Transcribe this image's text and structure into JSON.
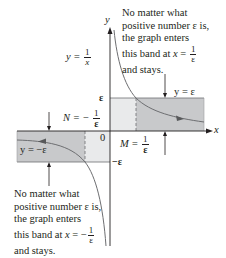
{
  "figure": {
    "type": "diagram",
    "curve_label": {
      "lhs": "y =",
      "num": "1",
      "den": "x"
    },
    "axes": {
      "x_label": "x",
      "y_label": "y",
      "origin_label": "0"
    },
    "y_ticks": {
      "top": "ε",
      "bottom": "−ε"
    },
    "band_labels": {
      "upper": "y = ε",
      "lower": "y = −ε"
    },
    "markers": {
      "M": {
        "lhs": "M =",
        "num": "1",
        "den": "ε"
      },
      "N": {
        "lhs": "N = −",
        "num": "1",
        "den": "ε"
      }
    },
    "notes": {
      "top_right": {
        "lines": [
          "No matter what",
          "positive number ε is,",
          "the graph enters"
        ],
        "last_prefix": "this band at ",
        "last_var": "x",
        "last_eq": " = ",
        "frac_num": "1",
        "frac_den": "ε",
        "final": "and stays."
      },
      "bottom_left": {
        "lines": [
          "No matter what",
          "positive number ε is,",
          "the graph enters"
        ],
        "last_prefix": "this band at ",
        "last_var": "x",
        "last_eq": " = −",
        "frac_num": "1",
        "frac_den": "ε",
        "final": "and stays."
      }
    },
    "colors": {
      "band_dark": "#c8c9cb",
      "band_light": "#e9eaeb",
      "axis": "#231f20",
      "curve": "#6d6e71",
      "text": "#231f20"
    }
  }
}
